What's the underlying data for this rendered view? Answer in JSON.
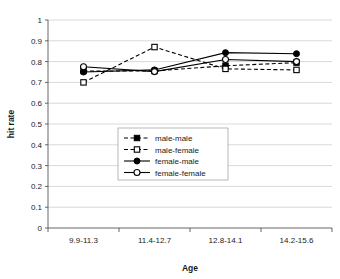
{
  "chart_data": {
    "type": "line",
    "title": "",
    "xlabel": "Age",
    "ylabel": "hit rate",
    "categories": [
      "9.9-11.3",
      "11.4-12.7",
      "12.8-14.1",
      "14.2-15.6"
    ],
    "ylim": [
      0,
      1
    ],
    "ytick_labels": [
      "0",
      "0.1",
      "0.2",
      "0.3",
      "0.4",
      "0.5",
      "0.6",
      "0.7",
      "0.8",
      "0.9",
      "1"
    ],
    "ytick_values": [
      0,
      0.1,
      0.2,
      0.3,
      0.4,
      0.5,
      0.6,
      0.7,
      0.8,
      0.9,
      1
    ],
    "grid": "horizontal",
    "legend_position": "center",
    "series": [
      {
        "name": "male-male",
        "marker": "filled-square",
        "line_style": "dashed",
        "color": "#000000",
        "values": [
          0.755,
          0.755,
          0.78,
          0.795
        ]
      },
      {
        "name": "male-female",
        "marker": "open-square",
        "line_style": "dashed",
        "color": "#000000",
        "values": [
          0.7,
          0.87,
          0.765,
          0.76
        ]
      },
      {
        "name": "female-male",
        "marker": "filled-circle",
        "line_style": "solid",
        "color": "#000000",
        "values": [
          0.75,
          0.76,
          0.843,
          0.838
        ]
      },
      {
        "name": "female-female",
        "marker": "open-circle",
        "line_style": "solid",
        "color": "#000000",
        "values": [
          0.775,
          0.752,
          0.81,
          0.8
        ]
      }
    ]
  }
}
